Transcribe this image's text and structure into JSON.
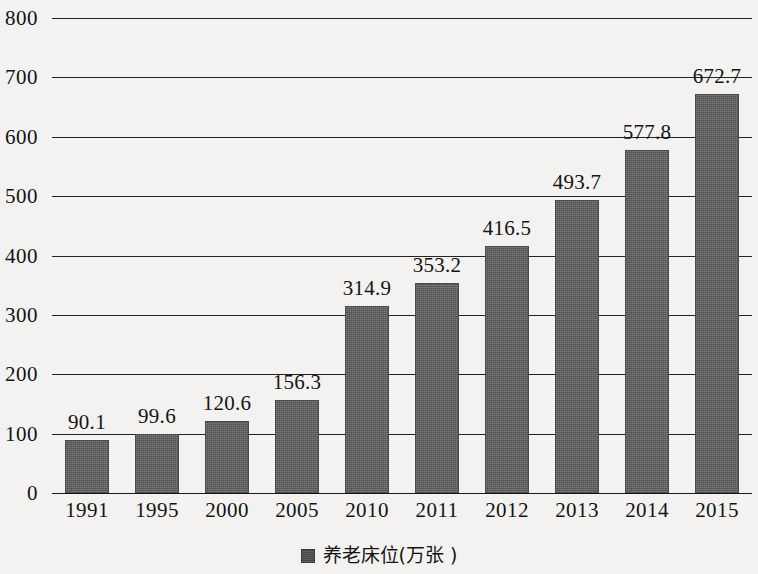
{
  "chart_data": {
    "type": "bar",
    "title": "",
    "subtitle": "",
    "xlabel": "",
    "ylabel": "",
    "categories": [
      "1991",
      "1995",
      "2000",
      "2005",
      "2010",
      "2011",
      "2012",
      "2013",
      "2014",
      "2015"
    ],
    "values": [
      90.1,
      99.6,
      120.6,
      156.3,
      314.9,
      353.2,
      416.5,
      493.7,
      577.8,
      672.7
    ],
    "data_labels": [
      "90.1",
      "99.6",
      "120.6",
      "156.3",
      "314.9",
      "353.2",
      "416.5",
      "493.7",
      "577.8",
      "672.7"
    ],
    "series": [
      {
        "name": "养老床位(万张 )",
        "values": [
          90.1,
          99.6,
          120.6,
          156.3,
          314.9,
          353.2,
          416.5,
          493.7,
          577.8,
          672.7
        ],
        "color": "#5a5a5a"
      }
    ],
    "ylim": [
      0,
      800
    ],
    "ytick_values": [
      0,
      100,
      200,
      300,
      400,
      500,
      600,
      700,
      800
    ],
    "ytick_labels": [
      "0",
      "100",
      "200",
      "300",
      "400",
      "500",
      "600",
      "700",
      "800"
    ],
    "grid": true,
    "grid_axis": "y",
    "legend": {
      "position": "bottom-center",
      "entries": [
        {
          "label": "养老床位(万张 )",
          "marker": "square",
          "color": "#4d4d4d"
        }
      ]
    },
    "background_color": "#f3f2f0",
    "axis_color": "#232323"
  }
}
